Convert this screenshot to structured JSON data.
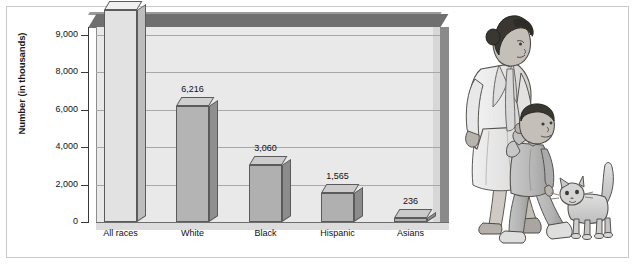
{
  "chart_data": {
    "type": "bar",
    "title": "",
    "subtitle": "",
    "xlabel": "",
    "ylabel": "Number (in thousands)",
    "categories": [
      "All races",
      "White",
      "Black",
      "Hispanic",
      "Asians"
    ],
    "values": [
      9681,
      6216,
      3060,
      1565,
      236
    ],
    "value_labels": [
      "9,681",
      "6,216",
      "3,060",
      "1,565",
      "236"
    ],
    "ytick_labels": [
      "0",
      "2,000",
      "4,000",
      "6,000",
      "8,000",
      "9,000"
    ],
    "ytick_values": [
      0,
      2000,
      4000,
      6000,
      8000,
      9000
    ],
    "ylim": [
      0,
      9681
    ],
    "grid": true,
    "legend": "none",
    "style": "3d-bar",
    "bar_colors": [
      "#e2e2e2",
      "#b4b4b4",
      "#b0b0b0",
      "#b0b0b0",
      "#b0b0b0"
    ],
    "bar_side_colors": [
      "#bdbdbd",
      "#8f8f8f",
      "#8c8c8c",
      "#8c8c8c",
      "#8c8c8c"
    ],
    "bar_top_colors": [
      "#f0f0f0",
      "#cfcfcf",
      "#cccccc",
      "#cccccc",
      "#c9c9c9"
    ]
  },
  "illustration": {
    "name": "woman-child-cat-illustration",
    "figures": [
      "woman",
      "child",
      "cat"
    ],
    "skin_color": "#b9b3ad",
    "hair_color": "#3a3631",
    "garment_color": "#ececec",
    "child_garment_color": "#b9b9b9",
    "cat_color": "#cfcfcf"
  },
  "frame": {
    "border_color": "#c9c9c9",
    "background": "#ffffff"
  }
}
